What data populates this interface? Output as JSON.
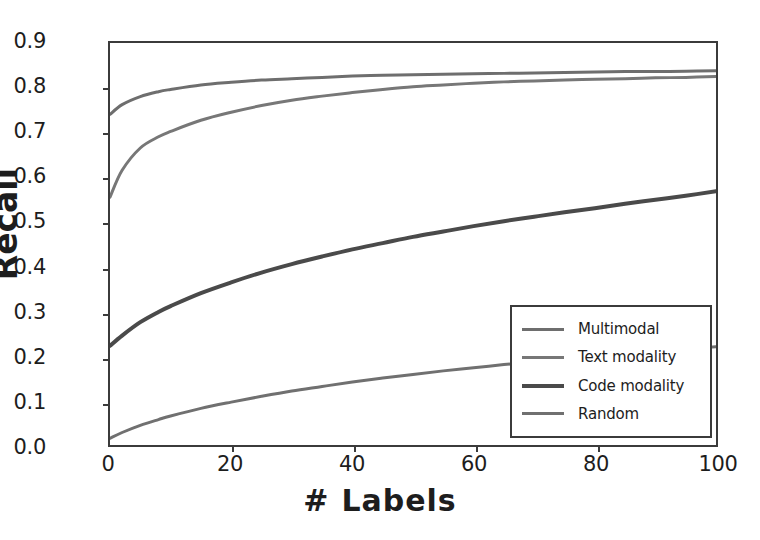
{
  "chart_data": {
    "type": "line",
    "title": "",
    "xlabel": "#  Labels",
    "ylabel": "Recall",
    "xlim": [
      0,
      100
    ],
    "ylim": [
      0.0,
      0.9
    ],
    "grid": false,
    "legend_position": "lower right",
    "xticks": [
      "0",
      "20",
      "40",
      "60",
      "80",
      "100"
    ],
    "xtick_values": [
      0,
      20,
      40,
      60,
      80,
      100
    ],
    "yticks": [
      "0.0",
      "0.1",
      "0.2",
      "0.3",
      "0.4",
      "0.5",
      "0.6",
      "0.7",
      "0.8",
      "0.9"
    ],
    "ytick_values": [
      0.0,
      0.1,
      0.2,
      0.3,
      0.4,
      0.5,
      0.6,
      0.7,
      0.8,
      0.9
    ],
    "x": [
      0,
      2,
      5,
      8,
      10,
      15,
      20,
      25,
      30,
      35,
      40,
      45,
      50,
      55,
      60,
      65,
      70,
      75,
      80,
      85,
      90,
      95,
      100
    ],
    "series": [
      {
        "name": "Multimodal",
        "color": "#6e6e6e",
        "width": 3,
        "values": [
          0.74,
          0.762,
          0.78,
          0.791,
          0.796,
          0.806,
          0.812,
          0.817,
          0.82,
          0.823,
          0.826,
          0.828,
          0.829,
          0.83,
          0.831,
          0.832,
          0.833,
          0.834,
          0.835,
          0.836,
          0.836,
          0.837,
          0.838
        ]
      },
      {
        "name": "Text modality",
        "color": "#777777",
        "width": 3,
        "values": [
          0.555,
          0.615,
          0.665,
          0.69,
          0.702,
          0.727,
          0.745,
          0.76,
          0.772,
          0.781,
          0.789,
          0.796,
          0.802,
          0.806,
          0.81,
          0.813,
          0.815,
          0.817,
          0.819,
          0.82,
          0.822,
          0.823,
          0.825
        ]
      },
      {
        "name": "Code modality",
        "color": "#4a4a4a",
        "width": 4,
        "values": [
          0.222,
          0.245,
          0.275,
          0.298,
          0.311,
          0.34,
          0.364,
          0.386,
          0.405,
          0.422,
          0.438,
          0.452,
          0.466,
          0.478,
          0.49,
          0.501,
          0.511,
          0.521,
          0.53,
          0.54,
          0.549,
          0.558,
          0.568
        ]
      },
      {
        "name": "Random",
        "color": "#707070",
        "width": 3,
        "values": [
          0.015,
          0.028,
          0.044,
          0.057,
          0.065,
          0.082,
          0.096,
          0.109,
          0.121,
          0.131,
          0.141,
          0.15,
          0.158,
          0.166,
          0.173,
          0.18,
          0.187,
          0.193,
          0.199,
          0.205,
          0.21,
          0.215,
          0.22
        ]
      }
    ]
  },
  "axes": {
    "frame_color": "#3b3b3b",
    "background": "#ffffff"
  },
  "legend": {
    "entries": [
      {
        "label": "Multimodal"
      },
      {
        "label": "Text modality"
      },
      {
        "label": "Code modality"
      },
      {
        "label": "Random"
      }
    ]
  },
  "xaxis_title_parts": {
    "hash": "#",
    "word": "Labels"
  }
}
